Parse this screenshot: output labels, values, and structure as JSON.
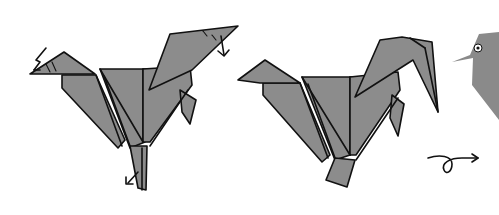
{
  "diagram": {
    "type": "origami-instruction-steps",
    "steps": [
      {
        "name": "step-crimp-fold-rooster",
        "arrows": [
          "zigzag-crimp-arrow-head",
          "fold-down-arrow-tail",
          "fold-arrow-foot"
        ]
      },
      {
        "name": "step-folded-rooster"
      },
      {
        "name": "step-finished-bird-partial"
      }
    ],
    "symbols": [
      {
        "name": "turn-over-symbol",
        "glyph": "loop-arrow"
      }
    ],
    "colors": {
      "paper": "#8c8c8c",
      "outline": "#111111",
      "background": "#ffffff",
      "eye_ring": "#ffffff"
    }
  }
}
